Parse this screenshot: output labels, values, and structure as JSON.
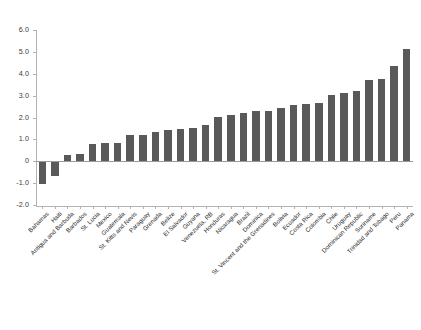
{
  "chart_data": {
    "type": "bar",
    "title": "",
    "subtitle": "",
    "xlabel": "",
    "ylabel": "",
    "ylim": [
      -2.0,
      6.0
    ],
    "grid": false,
    "legend": "none",
    "bar_color": "#595959",
    "axis_color": "#b4b4b4",
    "label_rotation": -45,
    "ytick_labels": [
      "6.0",
      "5.0",
      "4.0",
      "3.0",
      "2.0",
      "1.0",
      "0",
      "-1.0",
      "-2.0"
    ],
    "ytick_values": [
      6.0,
      5.0,
      4.0,
      3.0,
      2.0,
      1.0,
      0,
      -1.0,
      -2.0
    ],
    "categories": [
      "Bahamas",
      "Haiti",
      "Antigua and Barbuda",
      "Barbados",
      "St. Lucia",
      "Mexico",
      "Guatemala",
      "St. Kitts and Nevis",
      "Paraguay",
      "Grenada",
      "Belize",
      "El Salvador",
      "Guyana",
      "Venezuela, RB",
      "Honduras",
      "Nicaragua",
      "Brazil",
      "Dominica",
      "St. Vincent and the Grenadines",
      "Bolivia",
      "Ecuador",
      "Costa Rica",
      "Colombia",
      "Chile",
      "Uruguay",
      "Dominican Republic",
      "Suriname",
      "Trinidad and Tobago",
      "Peru",
      "Panama"
    ],
    "values": [
      -1.05,
      -0.68,
      0.28,
      0.31,
      0.77,
      0.85,
      0.85,
      1.18,
      1.21,
      1.36,
      1.43,
      1.47,
      1.5,
      1.68,
      2.03,
      2.12,
      2.19,
      2.3,
      2.32,
      2.45,
      2.58,
      2.62,
      2.68,
      3.02,
      3.1,
      3.22,
      3.72,
      3.78,
      4.35,
      5.15
    ]
  }
}
